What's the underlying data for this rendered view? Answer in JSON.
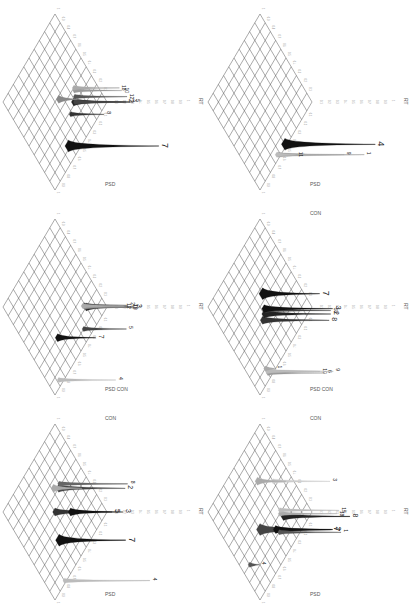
{
  "figure": {
    "orientation": "rotated 90 degrees clockwise",
    "layout": {
      "rows": 3,
      "cols": 2
    },
    "axis_labels": {
      "vertical": "RT",
      "left_base": "CON",
      "right_base": "PSD",
      "combined": "PSD CON"
    },
    "tick_labels": [
      "0.1",
      "0.2",
      "0.3",
      "0.4",
      "0.5",
      "0.6",
      "0.7",
      "0.8",
      "0.9",
      "1"
    ],
    "panels": [
      {
        "id": "top-left",
        "axes": {
          "rt": "RT",
          "left": "",
          "right": "PSD"
        },
        "peaks": [
          {
            "label": "7",
            "size": "large",
            "shade": "#111111",
            "pos": [
              0.62,
              0.12
            ],
            "height": 0.95
          },
          {
            "label": "8",
            "size": "small",
            "shade": "#333333",
            "pos": [
              0.42,
              0.28
            ],
            "height": 0.35
          },
          {
            "label": "2",
            "size": "medium",
            "shade": "#222222",
            "pos": [
              0.32,
              0.32
            ],
            "height": 0.55
          },
          {
            "label": "5",
            "size": "small",
            "shade": "#444444",
            "pos": [
              0.3,
              0.3
            ],
            "height": 0.6
          },
          {
            "label": "3",
            "size": "small",
            "shade": "#444444",
            "pos": [
              0.31,
              0.31
            ],
            "height": 0.58
          },
          {
            "label": "12",
            "size": "small",
            "shade": "#555555",
            "pos": [
              0.28,
              0.34
            ],
            "height": 0.55
          },
          {
            "label": "10",
            "size": "small",
            "shade": "#999999",
            "pos": [
              0.25,
              0.38
            ],
            "height": 0.5
          },
          {
            "label": "18",
            "size": "small",
            "shade": "#aaaaaa",
            "pos": [
              0.24,
              0.4
            ],
            "height": 0.48
          },
          {
            "label": "",
            "size": "medium",
            "shade": "#888888",
            "pos": [
              0.45,
              0.48
            ],
            "height": 0.2
          }
        ]
      },
      {
        "id": "top-right",
        "axes": {
          "rt": "RT",
          "left": "",
          "right": "PSD"
        },
        "peaks": [
          {
            "label": "4",
            "size": "large",
            "shade": "#111111",
            "pos": [
              0.5,
              0.02
            ],
            "height": 0.95
          },
          {
            "label": "1",
            "size": "small",
            "shade": "#999999",
            "pos": [
              0.62,
              0.02
            ],
            "height": 0.9
          },
          {
            "label": "9",
            "size": "small",
            "shade": "#aaaaaa",
            "pos": [
              0.63,
              0.03
            ],
            "height": 0.7
          },
          {
            "label": "11",
            "size": "small",
            "shade": "#bbbbbb",
            "pos": [
              0.64,
              0.04
            ],
            "height": 0.2
          }
        ]
      },
      {
        "id": "middle-left",
        "axes": {
          "rt": "RT",
          "left": "",
          "right": "PSD CON"
        },
        "peaks": [
          {
            "label": "4",
            "size": "small",
            "shade": "#bbbbbb",
            "pos": [
              0.88,
              0.05
            ],
            "height": 0.6
          },
          {
            "label": "7",
            "size": "medium",
            "shade": "#111111",
            "pos": [
              0.65,
              0.3
            ],
            "height": 0.4
          },
          {
            "label": "5",
            "size": "small",
            "shade": "#444444",
            "pos": [
              0.35,
              0.1
            ],
            "height": 0.45
          },
          {
            "label": "3",
            "size": "medium",
            "shade": "#222222",
            "pos": [
              0.2,
              0.2
            ],
            "height": 0.5
          },
          {
            "label": "10",
            "size": "small",
            "shade": "#666666",
            "pos": [
              0.21,
              0.21
            ],
            "height": 0.48
          },
          {
            "label": "18",
            "size": "small",
            "shade": "#888888",
            "pos": [
              0.22,
              0.22
            ],
            "height": 0.48
          },
          {
            "label": "2",
            "size": "small",
            "shade": "#555555",
            "pos": [
              0.21,
              0.23
            ],
            "height": 0.46
          },
          {
            "label": "12",
            "size": "small",
            "shade": "#aaaaaa",
            "pos": [
              0.23,
              0.24
            ],
            "height": 0.44
          }
        ]
      },
      {
        "id": "middle-right",
        "axes": {
          "rt": "RT",
          "left": "CON",
          "right": "PSD CON"
        },
        "peaks": [
          {
            "label": "6",
            "size": "small",
            "shade": "#999999",
            "pos": [
              0.8,
              0.05
            ],
            "height": 0.6
          },
          {
            "label": "10",
            "size": "small",
            "shade": "#aaaaaa",
            "pos": [
              0.79,
              0.06
            ],
            "height": 0.55
          },
          {
            "label": "9",
            "size": "small",
            "shade": "#bbbbbb",
            "pos": [
              0.8,
              0.07
            ],
            "height": 0.7
          },
          {
            "label": "1",
            "size": "small",
            "shade": "#aaaaaa",
            "pos": [
              0.8,
              0.1
            ],
            "height": 0.1
          },
          {
            "label": "8",
            "size": "medium",
            "shade": "#333333",
            "pos": [
              0.55,
              0.4
            ],
            "height": 0.7
          },
          {
            "label": "2",
            "size": "medium",
            "shade": "#222222",
            "pos": [
              0.5,
              0.42
            ],
            "height": 0.7
          },
          {
            "label": "18",
            "size": "small",
            "shade": "#444444",
            "pos": [
              0.48,
              0.44
            ],
            "height": 0.7
          },
          {
            "label": "3",
            "size": "medium",
            "shade": "#111111",
            "pos": [
              0.47,
              0.45
            ],
            "height": 0.72
          },
          {
            "label": "7",
            "size": "large",
            "shade": "#111111",
            "pos": [
              0.4,
              0.55
            ],
            "height": 0.6
          }
        ]
      },
      {
        "id": "bottom-left",
        "axes": {
          "rt": "RT",
          "left": "CON",
          "right": "PSD"
        },
        "peaks": [
          {
            "label": "4",
            "size": "small",
            "shade": "#bbbbbb",
            "pos": [
              0.8,
              0.02
            ],
            "height": 0.9
          },
          {
            "label": "7",
            "size": "large",
            "shade": "#111111",
            "pos": [
              0.62,
              0.3
            ],
            "height": 0.7
          },
          {
            "label": "5",
            "size": "medium",
            "shade": "#333333",
            "pos": [
              0.5,
              0.5
            ],
            "height": 0.6
          },
          {
            "label": "3",
            "size": "medium",
            "shade": "#111111",
            "pos": [
              0.35,
              0.35
            ],
            "height": 0.55
          },
          {
            "label": "2",
            "size": "medium",
            "shade": "#444444",
            "pos": [
              0.33,
              0.6
            ],
            "height": 0.7
          },
          {
            "label": "8",
            "size": "small",
            "shade": "#666666",
            "pos": [
              0.3,
              0.62
            ],
            "height": 0.72
          },
          {
            "label": "",
            "size": "medium",
            "shade": "#aaaaaa",
            "pos": [
              0.38,
              0.65
            ],
            "height": 0.3
          }
        ]
      },
      {
        "id": "bottom-right",
        "axes": {
          "rt": "RT",
          "left": "CON",
          "right": "PSD"
        },
        "peaks": [
          {
            "label": "4",
            "size": "small",
            "shade": "#555555",
            "pos": [
              0.9,
              0.3
            ],
            "height": 0.1
          },
          {
            "label": "7",
            "size": "large",
            "shade": "#444444",
            "pos": [
              0.6,
              0.4
            ],
            "height": 0.75
          },
          {
            "label": "2",
            "size": "medium",
            "shade": "#111111",
            "pos": [
              0.45,
              0.25
            ],
            "height": 0.6
          },
          {
            "label": "1",
            "size": "small",
            "shade": "#555555",
            "pos": [
              0.43,
              0.2
            ],
            "height": 0.65
          },
          {
            "label": "8",
            "size": "medium",
            "shade": "#222222",
            "pos": [
              0.3,
              0.25
            ],
            "height": 0.7
          },
          {
            "label": "18",
            "size": "small",
            "shade": "#aaaaaa",
            "pos": [
              0.32,
              0.3
            ],
            "height": 0.6
          },
          {
            "label": "15",
            "size": "small",
            "shade": "#bbbbbb",
            "pos": [
              0.3,
              0.32
            ],
            "height": 0.62
          },
          {
            "label": "3",
            "size": "small",
            "shade": "#cccccc",
            "pos": [
              0.2,
              0.55
            ],
            "height": 0.6
          },
          {
            "label": "",
            "size": "medium",
            "shade": "#aaaaaa",
            "pos": [
              0.35,
              0.7
            ],
            "height": 0.3
          }
        ]
      }
    ]
  }
}
